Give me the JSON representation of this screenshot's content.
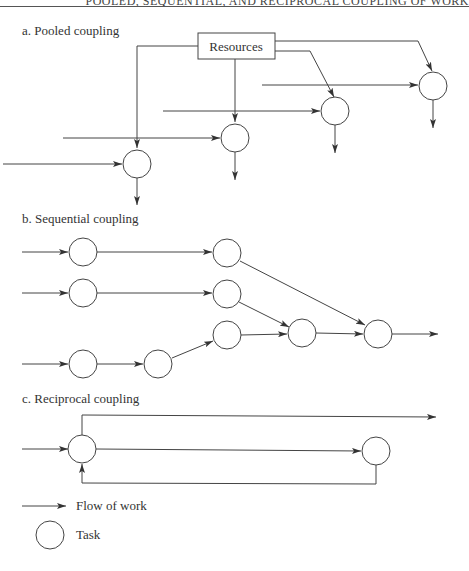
{
  "header": {
    "running_title": "POOLED, SEQUENTIAL, AND RECIPROCAL COUPLING OF WORK"
  },
  "panels": {
    "a": {
      "title": "a. Pooled coupling",
      "resource_label": "Resources"
    },
    "b": {
      "title": "b. Sequential coupling"
    },
    "c": {
      "title": "c. Reciprocal coupling"
    }
  },
  "legend": {
    "flow": {
      "icon": "arrow-right-icon",
      "label": "Flow of work"
    },
    "task": {
      "icon": "circle-icon",
      "label": "Task"
    }
  },
  "colors": {
    "line": "#333333",
    "background": "#ffffff"
  }
}
